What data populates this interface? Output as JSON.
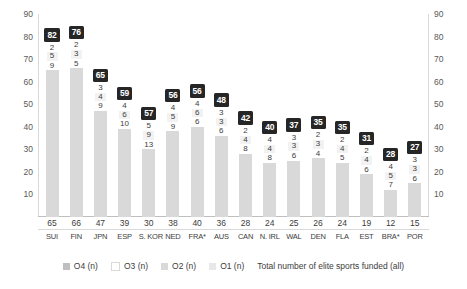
{
  "chart_data": {
    "type": "bar",
    "title": "",
    "subtitle": "",
    "xlabel": "",
    "ylabel": "",
    "ylim": [
      0,
      90
    ],
    "yticks": [
      90,
      80,
      70,
      60,
      50,
      40,
      30,
      20,
      10
    ],
    "grid": false,
    "legend_position": "bottom",
    "stacked": true,
    "categories": [
      "SUI",
      "FIN",
      "JPN",
      "ESP",
      "S. KOR",
      "NED",
      "FRA*",
      "AUS",
      "CAN",
      "N. IRL",
      "WAL",
      "DEN",
      "FLA",
      "EST",
      "BRA*",
      "POR"
    ],
    "series": [
      {
        "name": "Total number of elite sports funded (all)",
        "key": "total_funded",
        "color": "#d9d9d9",
        "values": [
          65,
          66,
          47,
          39,
          30,
          38,
          40,
          36,
          28,
          24,
          25,
          26,
          24,
          19,
          12,
          15
        ]
      },
      {
        "name": "O1 (n)",
        "key": "o1",
        "color": "#e8e8e8",
        "values": [
          9,
          5,
          9,
          10,
          13,
          9,
          6,
          6,
          8,
          8,
          6,
          4,
          5,
          6,
          7,
          6
        ]
      },
      {
        "name": "O2 (n)",
        "key": "o2",
        "color": "#f2f2f2",
        "values": [
          5,
          3,
          4,
          6,
          9,
          5,
          6,
          3,
          4,
          4,
          3,
          3,
          4,
          4,
          5,
          3
        ]
      },
      {
        "name": "O3 (n)",
        "key": "o3",
        "color": "#ffffff",
        "values": [
          2,
          2,
          3,
          4,
          5,
          4,
          4,
          3,
          2,
          4,
          3,
          2,
          2,
          2,
          4,
          3
        ]
      }
    ],
    "totals": [
      82,
      76,
      65,
      59,
      57,
      56,
      56,
      48,
      42,
      40,
      37,
      35,
      35,
      31,
      28,
      27
    ],
    "totals_label": "O4 (n)",
    "legend": [
      {
        "label": "O4 (n)",
        "color": "#bfbfbf"
      },
      {
        "label": "O3 (n)",
        "color": "#ffffff"
      },
      {
        "label": "O2 (n)",
        "color": "#d9d9d9"
      },
      {
        "label": "O1 (n)",
        "color": "#e8e8e8"
      }
    ],
    "legend_note": "Total number of elite sports funded (all)",
    "colors": {
      "bar": "#d9d9d9",
      "badge_bg": "#262626",
      "badge_text": "#ffffff",
      "text": "#3c3c3c",
      "axis": "#d9d9d9"
    }
  }
}
